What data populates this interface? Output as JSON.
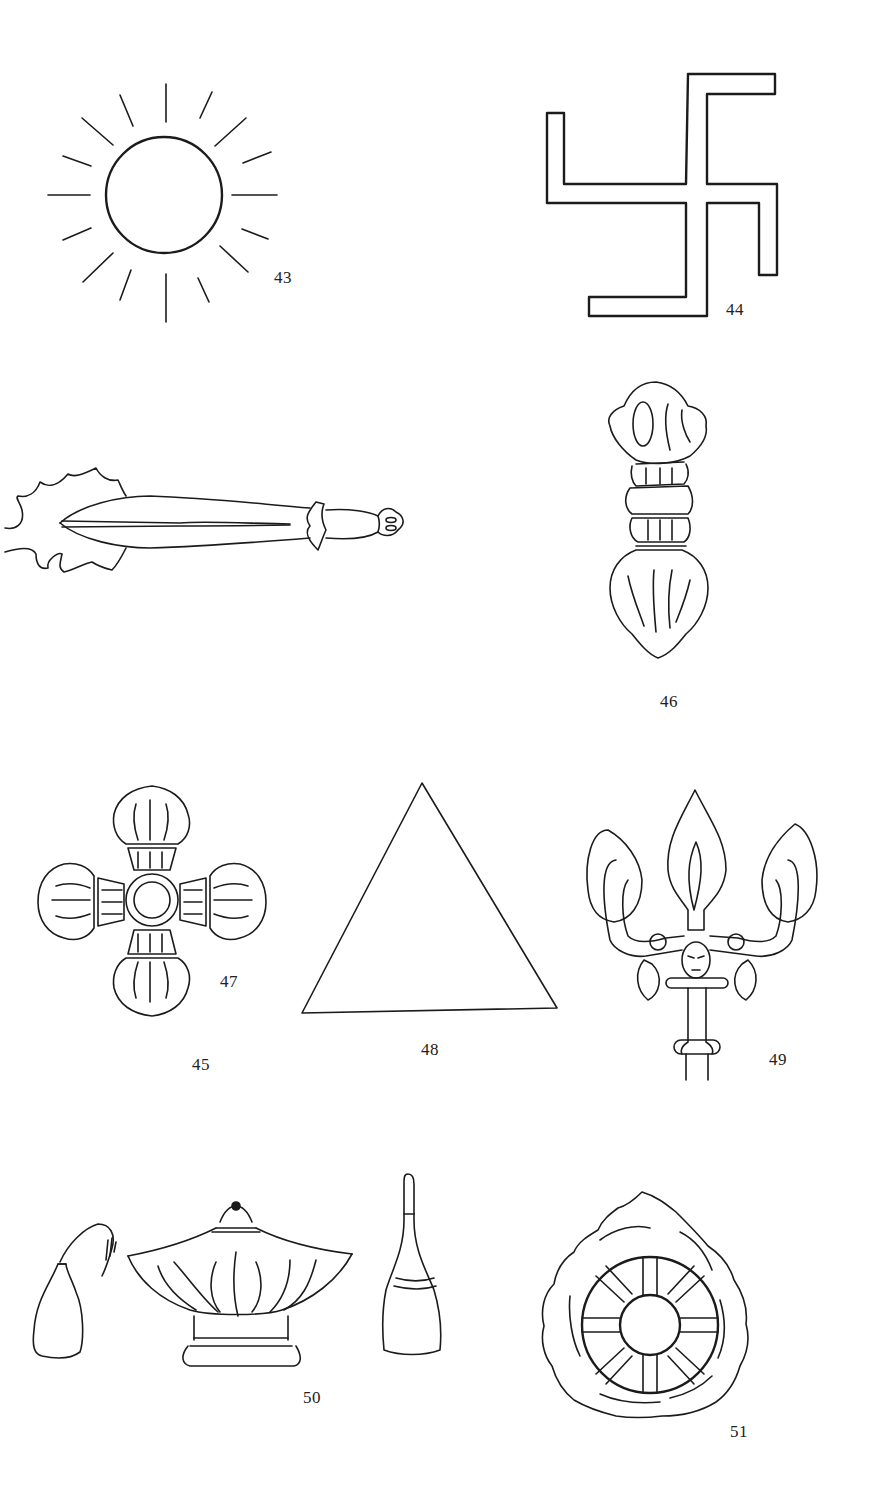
{
  "page": {
    "background": "#ffffff",
    "ink_color": "#1b1b1b"
  },
  "figures": [
    {
      "number": "43",
      "label": "43",
      "icon": "sun-icon"
    },
    {
      "number": "44",
      "label": "44",
      "icon": "swastika-icon"
    },
    {
      "number": "45",
      "label": "45",
      "icon": "flaming-sword-icon"
    },
    {
      "number": "46",
      "label": "46",
      "icon": "vajra-icon"
    },
    {
      "number": "47",
      "label": "47",
      "icon": "double-vajra-icon"
    },
    {
      "number": "48",
      "label": "48",
      "icon": "triangle-icon"
    },
    {
      "number": "49",
      "label": "49",
      "icon": "trident-icon"
    },
    {
      "number": "50",
      "label": "50",
      "icon": "ritual-vessels-icon"
    },
    {
      "number": "51",
      "label": "51",
      "icon": "dharma-wheel-icon"
    }
  ]
}
